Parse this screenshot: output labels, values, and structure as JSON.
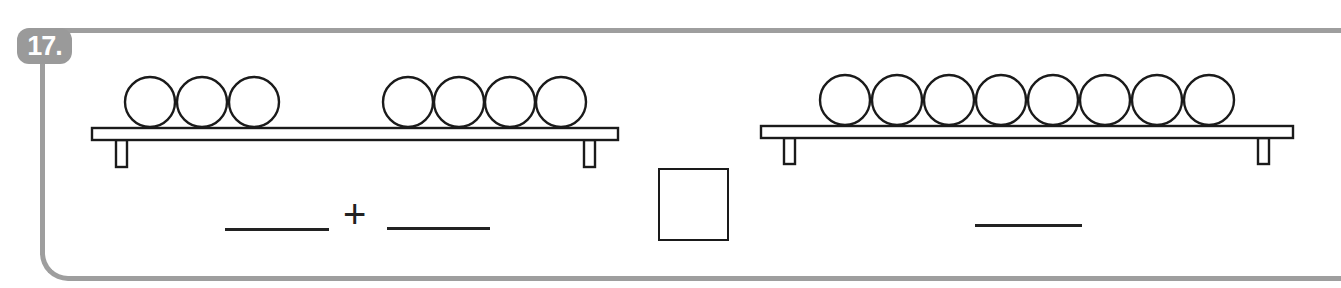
{
  "problem": {
    "number_label": "17.",
    "left_picture": {
      "group_a_count": 3,
      "group_b_count": 4
    },
    "right_picture": {
      "ball_count": 8
    },
    "equation": {
      "left_blank": "",
      "operator": "+",
      "right_blank": "",
      "comparison_box": "",
      "result_blank": ""
    }
  },
  "colors": {
    "frame": "#9e9e9e",
    "badge": "#9a9a9a",
    "ink": "#1a1a1a"
  }
}
